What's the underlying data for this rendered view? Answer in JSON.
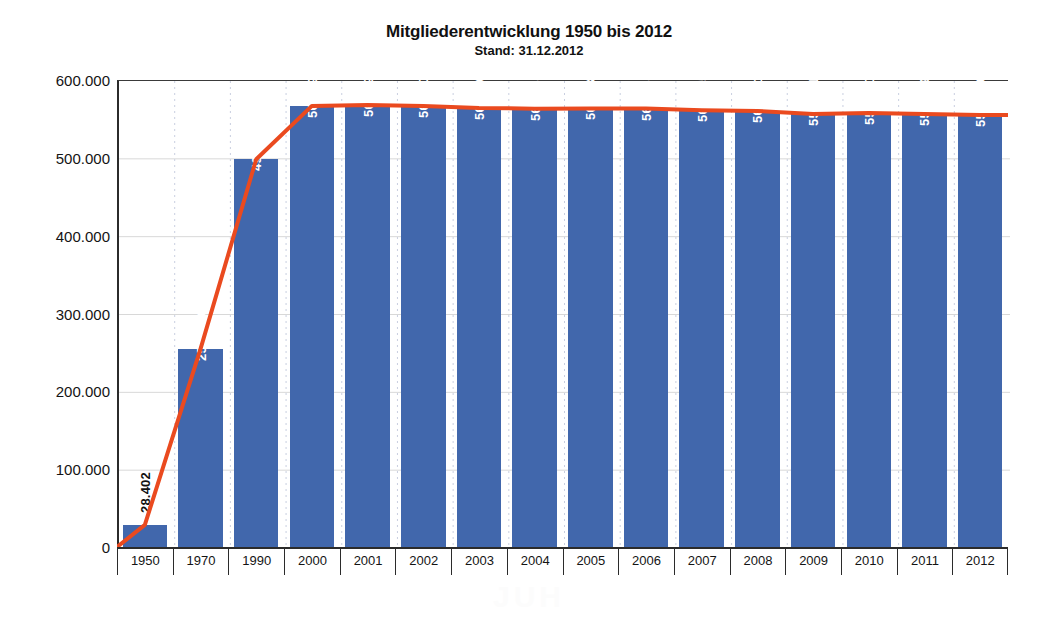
{
  "chart_data": {
    "type": "bar",
    "title": "Mitgliederentwicklung 1950 bis 2012",
    "subtitle": "Stand: 31.12.2012",
    "xlabel": "",
    "ylabel": "",
    "ylim": [
      0,
      600000
    ],
    "grid": true,
    "legend": "none",
    "categories": [
      "1950",
      "1970",
      "1990",
      "2000",
      "2001",
      "2002",
      "2003",
      "2004",
      "2005",
      "2006",
      "2007",
      "2008",
      "2009",
      "2010",
      "2011",
      "2012"
    ],
    "values": [
      28402,
      254539,
      498141,
      566699,
      567798,
      566609,
      564005,
      563187,
      563534,
      563380,
      561045,
      560201,
      556291,
      557740,
      556269,
      555049
    ],
    "value_labels": [
      "28.402",
      "254.539",
      "498.141",
      "566.699",
      "567.798",
      "566.609",
      "564.005",
      "563.187",
      "563.534",
      "563.380",
      "561.045",
      "560.201",
      "556.291",
      "557.740",
      "556.269",
      "555.049"
    ],
    "ytick_labels": [
      "600.000",
      "500.000",
      "400.000",
      "300.000",
      "200.000",
      "100.000",
      "0"
    ],
    "yticks": [
      600000,
      500000,
      400000,
      300000,
      200000,
      100000,
      0
    ],
    "series": [
      {
        "name": "Balken",
        "type": "bar",
        "color": "#4167ac",
        "values": [
          28402,
          254539,
          498141,
          566699,
          567798,
          566609,
          564005,
          563187,
          563534,
          563380,
          561045,
          560201,
          556291,
          557740,
          556269,
          555049
        ]
      },
      {
        "name": "Trendlinie",
        "type": "line",
        "color": "#ea4a1f",
        "starts_at_origin": true,
        "values": [
          28402,
          254539,
          498141,
          566699,
          567798,
          566609,
          564005,
          563187,
          563534,
          563380,
          561045,
          560201,
          556291,
          557740,
          556269,
          555049
        ]
      }
    ]
  },
  "colors": {
    "bar": "#4167ac",
    "line": "#ea4a1f",
    "axis": "#2b2b2b",
    "grid": "#d8d8d8",
    "background": "#ffffff",
    "label_inside": "#ffffff",
    "label_outside": "#111111"
  },
  "watermark": {
    "text": "JUH"
  }
}
